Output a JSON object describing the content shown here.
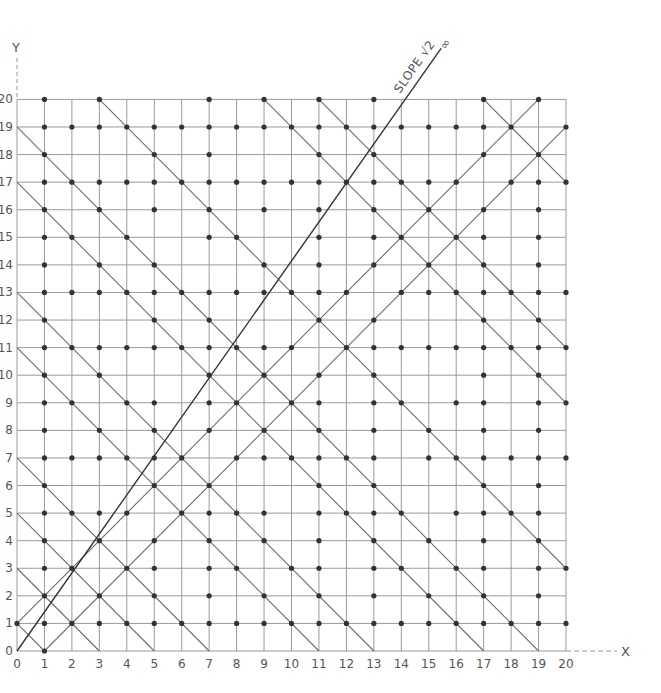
{
  "figure": {
    "x_axis_label": "X",
    "y_axis_label": "Y",
    "slope_line_label": "SLOPE √2",
    "slope_line_end_label": "∞",
    "colors": {
      "background": "#ffffff",
      "grid": "#9a9a9a",
      "diagonal": "#6e6e6e",
      "slope_line": "#333333",
      "dot": "#333333",
      "text": "#555555"
    }
  },
  "chart_data": {
    "type": "scatter",
    "title": "",
    "xlabel": "X",
    "ylabel": "Y",
    "xlim": [
      0,
      20
    ],
    "ylim": [
      0,
      20
    ],
    "grid": true,
    "x_ticks": [
      0,
      1,
      2,
      3,
      4,
      5,
      6,
      7,
      8,
      9,
      10,
      11,
      12,
      13,
      14,
      15,
      16,
      17,
      18,
      19,
      20
    ],
    "y_ticks": [
      0,
      1,
      2,
      3,
      4,
      5,
      6,
      7,
      8,
      9,
      10,
      11,
      12,
      13,
      14,
      15,
      16,
      17,
      18,
      19,
      20
    ],
    "points_rule": "lattice points (x,y) with 0<=x,y<=20 and gcd(x,y)=1",
    "anti_diagonal_lines_x_plus_y": [
      1,
      3,
      5,
      7,
      11,
      13,
      17,
      19,
      23,
      29,
      31,
      37
    ],
    "diagonal_lines": [
      "y = x + 1",
      "y = x - 1"
    ],
    "slope_line": {
      "label": "SLOPE √2",
      "slope": 1.41421356,
      "from": [
        0,
        0
      ],
      "to_x": 15.45,
      "end_label": "∞"
    }
  }
}
